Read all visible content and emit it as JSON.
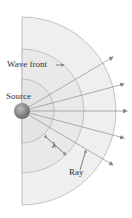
{
  "diagram": {
    "labels": {
      "wave_front": "Wave front",
      "source": "Source",
      "wavelength": "λ",
      "ray": "Ray"
    },
    "colors": {
      "wave_fill": "#e9e9e9",
      "wave_stroke": "#aaaaaa",
      "ray": "#999999",
      "source": "#8a8a8a",
      "text": "#333333"
    },
    "source_position": [
      22,
      111
    ],
    "wave_front_radii": [
      32,
      62,
      94
    ],
    "ray_count": 5
  }
}
